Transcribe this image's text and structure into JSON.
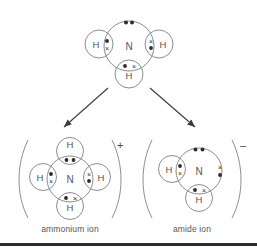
{
  "diagram": {
    "line_color": "#8c8c92",
    "text_color": "#55555a",
    "electron_dot_color": "#2b2b2b",
    "electron_cross_color": "#2b2b2b",
    "background": "#ffffff"
  },
  "molecules": {
    "ammonia": {
      "center_label": "N",
      "hydrogens": [
        {
          "position": "left",
          "label": "H",
          "bond_electrons": "dot-over-cross"
        },
        {
          "position": "right",
          "label": "H",
          "bond_electrons": "cross-over-dot"
        },
        {
          "position": "bottom",
          "label": "H",
          "bond_electrons": "dot-cross"
        }
      ],
      "lone_pairs": [
        {
          "position": "top",
          "electrons": "dot-dot"
        }
      ],
      "caption": ""
    },
    "ammonium": {
      "center_label": "N",
      "charge": "+",
      "hydrogens": [
        {
          "position": "top",
          "label": "H",
          "bond_electrons": "dot-dot"
        },
        {
          "position": "left",
          "label": "H",
          "bond_electrons": "dot-over-cross"
        },
        {
          "position": "right",
          "label": "H",
          "bond_electrons": "cross-over-dot"
        },
        {
          "position": "bottom",
          "label": "H",
          "bond_electrons": "dot-cross"
        }
      ],
      "lone_pairs": [],
      "caption": "ammonium ion"
    },
    "amide": {
      "center_label": "N",
      "charge": "–",
      "hydrogens": [
        {
          "position": "left",
          "label": "H",
          "bond_electrons": "dot-over-cross"
        },
        {
          "position": "bottom",
          "label": "H",
          "bond_electrons": "dot-cross"
        }
      ],
      "lone_pairs": [
        {
          "position": "top",
          "electrons": "dot-dot"
        },
        {
          "position": "right",
          "electrons": "cross-over-dot"
        }
      ],
      "caption": "amide ion"
    }
  },
  "arrows": [
    {
      "name": "arrow-to-ammonium",
      "direction": "down-left"
    },
    {
      "name": "arrow-to-amide",
      "direction": "down-right"
    }
  ]
}
